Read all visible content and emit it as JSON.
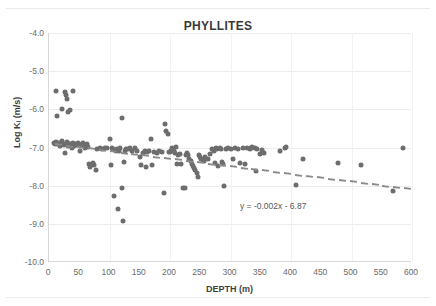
{
  "chart_data": {
    "type": "scatter",
    "title": "PHYLLITES",
    "xlabel": "DEPTH (m)",
    "ylabel": "Log K (m/s)",
    "ylabel_sub": "i",
    "xlim": [
      0,
      600
    ],
    "ylim": [
      -10.0,
      -4.0
    ],
    "xticks": [
      "0",
      "50",
      "100",
      "150",
      "200",
      "250",
      "300",
      "350",
      "400",
      "450",
      "500",
      "550",
      "600"
    ],
    "xtick_values": [
      0,
      50,
      100,
      150,
      200,
      250,
      300,
      350,
      400,
      450,
      500,
      550,
      600
    ],
    "yticks": [
      "-4.0",
      "-5.0",
      "-6.0",
      "-7.0",
      "-8.0",
      "-9.0",
      "-10.0"
    ],
    "ytick_values": [
      -4.0,
      -5.0,
      -6.0,
      -7.0,
      -8.0,
      -9.0,
      -10.0
    ],
    "grid": true,
    "legend": "none",
    "marker_color": "#6d6d6d",
    "trendline": {
      "equation": "y = -0.002x - 6.87",
      "slope": -0.002,
      "intercept": -6.87,
      "style": "dashed",
      "color": "#8a8a8a",
      "x_start": 10,
      "x_end": 600,
      "label_x": 400,
      "label_y": -8.55
    },
    "series": [
      {
        "name": "Phyllites hydraulic conductivity",
        "points": [
          [
            12,
            -5.52
          ],
          [
            14,
            -6.17
          ],
          [
            22,
            -5.98
          ],
          [
            27,
            -5.55
          ],
          [
            28,
            -5.62
          ],
          [
            30,
            -5.72
          ],
          [
            32,
            -6.08
          ],
          [
            34,
            -6.02
          ],
          [
            40,
            -5.52
          ],
          [
            8,
            -6.88
          ],
          [
            10,
            -6.9
          ],
          [
            12,
            -6.85
          ],
          [
            14,
            -6.92
          ],
          [
            16,
            -6.87
          ],
          [
            18,
            -6.95
          ],
          [
            20,
            -6.88
          ],
          [
            21,
            -6.82
          ],
          [
            23,
            -6.9
          ],
          [
            25,
            -6.93
          ],
          [
            26,
            -7.14
          ],
          [
            28,
            -6.9
          ],
          [
            30,
            -6.86
          ],
          [
            32,
            -6.95
          ],
          [
            34,
            -6.9
          ],
          [
            36,
            -6.92
          ],
          [
            38,
            -7.0
          ],
          [
            40,
            -6.88
          ],
          [
            42,
            -6.97
          ],
          [
            44,
            -6.9
          ],
          [
            46,
            -6.94
          ],
          [
            48,
            -6.88
          ],
          [
            50,
            -6.9
          ],
          [
            52,
            -7.1
          ],
          [
            54,
            -6.93
          ],
          [
            56,
            -6.88
          ],
          [
            58,
            -6.95
          ],
          [
            60,
            -7.02
          ],
          [
            62,
            -6.9
          ],
          [
            64,
            -6.98
          ],
          [
            66,
            -7.44
          ],
          [
            68,
            -7.52
          ],
          [
            70,
            -7.47
          ],
          [
            72,
            -7.41
          ],
          [
            74,
            -7.46
          ],
          [
            78,
            -7.6
          ],
          [
            80,
            -7.03
          ],
          [
            84,
            -7.0
          ],
          [
            88,
            -7.05
          ],
          [
            92,
            -7.0
          ],
          [
            96,
            -7.02
          ],
          [
            100,
            -6.78
          ],
          [
            102,
            -7.46
          ],
          [
            104,
            -7.0
          ],
          [
            106,
            -7.05
          ],
          [
            108,
            -8.27
          ],
          [
            110,
            -7.08
          ],
          [
            112,
            -7.03
          ],
          [
            114,
            -8.62
          ],
          [
            116,
            -7.1
          ],
          [
            118,
            -7.0
          ],
          [
            120,
            -6.22
          ],
          [
            121,
            -8.07
          ],
          [
            122,
            -8.93
          ],
          [
            124,
            -7.38
          ],
          [
            126,
            -7.1
          ],
          [
            128,
            -7.04
          ],
          [
            130,
            -7.05
          ],
          [
            134,
            -7.0
          ],
          [
            138,
            -7.08
          ],
          [
            142,
            -7.02
          ],
          [
            146,
            -7.1
          ],
          [
            150,
            -7.26
          ],
          [
            152,
            -7.45
          ],
          [
            155,
            -7.14
          ],
          [
            158,
            -7.08
          ],
          [
            160,
            -7.5
          ],
          [
            162,
            -7.12
          ],
          [
            166,
            -7.1
          ],
          [
            168,
            -6.78
          ],
          [
            170,
            -7.46
          ],
          [
            174,
            -7.12
          ],
          [
            178,
            -7.15
          ],
          [
            182,
            -7.1
          ],
          [
            186,
            -7.12
          ],
          [
            190,
            -8.2
          ],
          [
            192,
            -6.38
          ],
          [
            194,
            -6.58
          ],
          [
            196,
            -6.65
          ],
          [
            198,
            -7.13
          ],
          [
            200,
            -7.12
          ],
          [
            202,
            -7.08
          ],
          [
            204,
            -7.0
          ],
          [
            206,
            -7.1
          ],
          [
            208,
            -7.14
          ],
          [
            210,
            -6.98
          ],
          [
            212,
            -7.44
          ],
          [
            214,
            -7.2
          ],
          [
            216,
            -7.18
          ],
          [
            218,
            -7.42
          ],
          [
            222,
            -8.06
          ],
          [
            224,
            -8.07
          ],
          [
            226,
            -7.2
          ],
          [
            228,
            -7.15
          ],
          [
            230,
            -7.2
          ],
          [
            232,
            -7.3
          ],
          [
            234,
            -7.36
          ],
          [
            236,
            -7.42
          ],
          [
            238,
            -7.48
          ],
          [
            240,
            -7.54
          ],
          [
            242,
            -7.6
          ],
          [
            244,
            -7.68
          ],
          [
            246,
            -7.76
          ],
          [
            248,
            -7.2
          ],
          [
            250,
            -7.25
          ],
          [
            252,
            -7.3
          ],
          [
            254,
            -7.33
          ],
          [
            256,
            -7.36
          ],
          [
            258,
            -7.24
          ],
          [
            262,
            -7.3
          ],
          [
            266,
            -7.18
          ],
          [
            270,
            -7.05
          ],
          [
            272,
            -7.08
          ],
          [
            274,
            -7.4
          ],
          [
            276,
            -7.02
          ],
          [
            278,
            -7.05
          ],
          [
            280,
            -7.48
          ],
          [
            282,
            -7.0
          ],
          [
            284,
            -7.05
          ],
          [
            286,
            -7.38
          ],
          [
            288,
            -7.42
          ],
          [
            290,
            -8.0
          ],
          [
            292,
            -7.05
          ],
          [
            296,
            -7.0
          ],
          [
            300,
            -7.04
          ],
          [
            304,
            -7.3
          ],
          [
            308,
            -7.02
          ],
          [
            312,
            -7.05
          ],
          [
            316,
            -7.4
          ],
          [
            320,
            -7.02
          ],
          [
            324,
            -7.42
          ],
          [
            328,
            -7.0
          ],
          [
            332,
            -7.05
          ],
          [
            334,
            -7.02
          ],
          [
            336,
            -6.98
          ],
          [
            340,
            -7.0
          ],
          [
            342,
            -7.62
          ],
          [
            344,
            -7.04
          ],
          [
            348,
            -7.18
          ],
          [
            352,
            -7.06
          ],
          [
            356,
            -7.15
          ],
          [
            382,
            -7.08
          ],
          [
            390,
            -7.0
          ],
          [
            392,
            -6.98
          ],
          [
            408,
            -7.98
          ],
          [
            420,
            -7.3
          ],
          [
            478,
            -7.4
          ],
          [
            516,
            -7.45
          ],
          [
            568,
            -8.14
          ],
          [
            585,
            -7.02
          ]
        ]
      }
    ]
  }
}
